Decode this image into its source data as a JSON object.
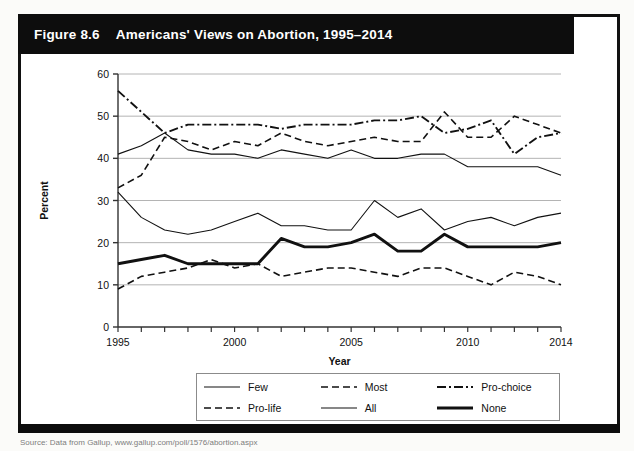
{
  "figure": {
    "number": "Figure 8.6",
    "title": "Americans' Views on Abortion, 1995–2014",
    "source": "Source: Data from Gallup, www.gallup.com/poll/1576/abortion.aspx"
  },
  "legend": {
    "items": [
      {
        "label": "Few",
        "style": "thin-solid",
        "icon": "line-solid-icon"
      },
      {
        "label": "Most",
        "style": "dashed",
        "icon": "line-dashed-icon"
      },
      {
        "label": "Pro-choice",
        "style": "dash-dot",
        "icon": "line-dash-dot-icon"
      },
      {
        "label": "Pro-life",
        "style": "dashed",
        "icon": "line-dashed-icon"
      },
      {
        "label": "All",
        "style": "thin-solid",
        "icon": "line-solid-icon"
      },
      {
        "label": "None",
        "style": "thick-solid",
        "icon": "line-thick-icon"
      }
    ]
  },
  "chart_data": {
    "type": "line",
    "title": "Americans' Views on Abortion, 1995–2014",
    "xlabel": "Year",
    "ylabel": "Percent",
    "xlim": [
      1995,
      2014
    ],
    "ylim": [
      0,
      60
    ],
    "yticks": [
      0,
      10,
      20,
      30,
      40,
      50,
      60
    ],
    "xticks": [
      1995,
      1996,
      1997,
      1998,
      1999,
      2000,
      2001,
      2002,
      2003,
      2004,
      2005,
      2006,
      2007,
      2008,
      2009,
      2010,
      2011,
      2012,
      2013,
      2014
    ],
    "xtick_labels_shown": [
      1995,
      2000,
      2005,
      2010,
      2014
    ],
    "grid": "horizontal",
    "legend_position": "below",
    "x": [
      1995,
      1996,
      1997,
      1998,
      1999,
      2000,
      2001,
      2002,
      2003,
      2004,
      2005,
      2006,
      2007,
      2008,
      2009,
      2010,
      2011,
      2012,
      2013,
      2014
    ],
    "series": [
      {
        "name": "Pro-choice",
        "style": "dash-dot",
        "values": [
          56,
          51,
          46,
          48,
          48,
          48,
          48,
          47,
          48,
          48,
          48,
          49,
          49,
          50,
          46,
          47,
          49,
          41,
          45,
          46
        ]
      },
      {
        "name": "Pro-life",
        "style": "dashed",
        "values": [
          33,
          36,
          45,
          44,
          42,
          44,
          43,
          46,
          44,
          43,
          44,
          45,
          44,
          44,
          51,
          45,
          45,
          50,
          48,
          46
        ]
      },
      {
        "name": "All",
        "style": "thin-solid",
        "values": [
          41,
          43,
          46,
          42,
          41,
          41,
          40,
          42,
          41,
          40,
          42,
          40,
          40,
          41,
          41,
          38,
          38,
          38,
          38,
          36
        ]
      },
      {
        "name": "Few",
        "style": "thin-solid",
        "values": [
          32,
          26,
          23,
          22,
          23,
          25,
          27,
          24,
          24,
          23,
          23,
          30,
          26,
          28,
          23,
          25,
          26,
          24,
          26,
          27
        ]
      },
      {
        "name": "None",
        "style": "thick-solid",
        "values": [
          15,
          16,
          17,
          15,
          15,
          15,
          15,
          21,
          19,
          19,
          20,
          22,
          18,
          18,
          22,
          19,
          19,
          19,
          19,
          20
        ]
      },
      {
        "name": "Most",
        "style": "dashed",
        "values": [
          9,
          12,
          13,
          14,
          16,
          14,
          15,
          12,
          13,
          14,
          14,
          13,
          12,
          14,
          14,
          12,
          10,
          13,
          12,
          10
        ]
      }
    ]
  }
}
